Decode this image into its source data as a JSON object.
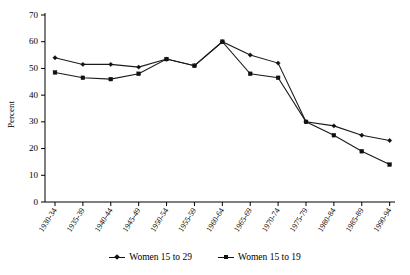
{
  "chart_data": {
    "type": "line",
    "title": "",
    "xlabel": "",
    "ylabel": "Percent",
    "ylim": [
      0,
      70
    ],
    "ytick_step": 10,
    "yticks": [
      "0",
      "10",
      "20",
      "30",
      "40",
      "50",
      "60",
      "70"
    ],
    "grid": false,
    "legend_position": "bottom-center",
    "categories": [
      "1930-34",
      "1935-39",
      "1940-44",
      "1945-49",
      "1950-54",
      "1955-59",
      "1960-64",
      "1965-69",
      "1970-74",
      "1975-79",
      "1980-84",
      "1985-89",
      "1990-94"
    ],
    "series": [
      {
        "name": "Women 15 to 29",
        "marker": "diamond",
        "color": "#111111",
        "values": [
          54.0,
          51.5,
          51.5,
          50.5,
          53.5,
          51.0,
          60.0,
          55.0,
          52.0,
          30.0,
          28.5,
          25.0,
          23.0
        ]
      },
      {
        "name": "Women 15 to 19",
        "marker": "square",
        "color": "#111111",
        "values": [
          48.5,
          46.5,
          46.0,
          48.0,
          53.5,
          51.0,
          60.0,
          48.0,
          46.5,
          30.0,
          25.0,
          19.0,
          14.0
        ]
      }
    ]
  }
}
